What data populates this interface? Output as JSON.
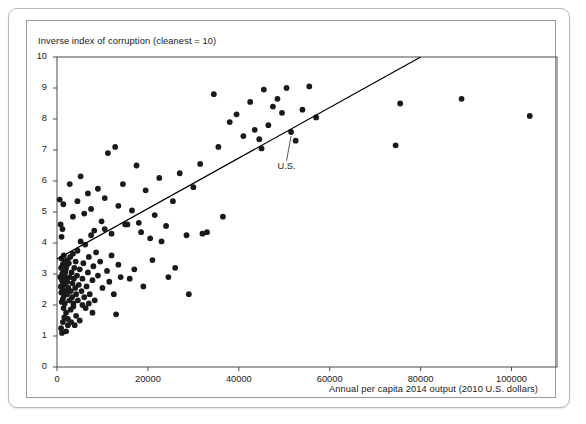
{
  "figure": {
    "background": "#ffffff",
    "frame_color": "#b8b8b8",
    "inner_frame_color": "#9a9a9a"
  },
  "chart_data": {
    "type": "scatter",
    "title": "",
    "subtitle": "",
    "xlabel": "Annual per capita 2014 output (2010 U.S. dollars)",
    "ylabel": "Inverse index of corruption (cleanest = 10)",
    "xlim": [
      0,
      110000
    ],
    "ylim": [
      0,
      10
    ],
    "xticks": [
      0,
      20000,
      40000,
      60000,
      80000,
      100000
    ],
    "xticklabels": [
      "0",
      "20000",
      "40000",
      "60000",
      "80000",
      "100000"
    ],
    "yticks": [
      0,
      1,
      2,
      3,
      4,
      5,
      6,
      7,
      8,
      9,
      10
    ],
    "yticklabels": [
      "0",
      "1",
      "2",
      "3",
      "4",
      "5",
      "6",
      "7",
      "8",
      "9",
      "10"
    ],
    "grid": false,
    "legend": null,
    "marker_color": "#1a1a1a",
    "marker_size": 4.2,
    "trendline": {
      "name": "regression line",
      "color": "#000000",
      "width": 1.3,
      "x_start": 0,
      "y_start": 3.48,
      "x_end": 80000,
      "y_end": 10.0
    },
    "annotations": [
      {
        "label": "U.S.",
        "point_x": 51500,
        "point_y": 7.58,
        "text_x": 50500,
        "text_y": 6.72
      }
    ],
    "points": [
      [
        700,
        2.9
      ],
      [
        850,
        2.6
      ],
      [
        900,
        3.2
      ],
      [
        950,
        2.4
      ],
      [
        1000,
        3.5
      ],
      [
        1050,
        2.1
      ],
      [
        1100,
        2.8
      ],
      [
        1150,
        3.0
      ],
      [
        1200,
        2.5
      ],
      [
        1250,
        3.3
      ],
      [
        1300,
        2.2
      ],
      [
        1350,
        2.7
      ],
      [
        1400,
        3.1
      ],
      [
        1450,
        1.9
      ],
      [
        1500,
        3.6
      ],
      [
        1550,
        2.3
      ],
      [
        1600,
        2.95
      ],
      [
        1650,
        3.4
      ],
      [
        1700,
        2.05
      ],
      [
        1750,
        2.65
      ],
      [
        1800,
        3.05
      ],
      [
        1900,
        2.45
      ],
      [
        1950,
        3.15
      ],
      [
        2000,
        1.75
      ],
      [
        2050,
        2.85
      ],
      [
        2100,
        3.25
      ],
      [
        2200,
        2.35
      ],
      [
        2250,
        2.75
      ],
      [
        2300,
        3.45
      ],
      [
        2400,
        1.55
      ],
      [
        2500,
        2.55
      ],
      [
        2600,
        3.35
      ],
      [
        2700,
        2.15
      ],
      [
        2800,
        2.9
      ],
      [
        2900,
        3.55
      ],
      [
        3000,
        2.45
      ],
      [
        3100,
        1.45
      ],
      [
        3200,
        3.05
      ],
      [
        3300,
        2.25
      ],
      [
        3400,
        2.7
      ],
      [
        3500,
        3.65
      ],
      [
        3600,
        2.05
      ],
      [
        3700,
        2.85
      ],
      [
        3800,
        3.2
      ],
      [
        3900,
        1.35
      ],
      [
        4000,
        2.55
      ],
      [
        4100,
        3.4
      ],
      [
        4200,
        2.35
      ],
      [
        4400,
        2.95
      ],
      [
        4500,
        3.75
      ],
      [
        4600,
        2.15
      ],
      [
        4800,
        2.65
      ],
      [
        5000,
        3.15
      ],
      [
        5200,
        4.05
      ],
      [
        5400,
        2.45
      ],
      [
        5600,
        2.85
      ],
      [
        5800,
        3.35
      ],
      [
        6000,
        2.25
      ],
      [
        6200,
        3.95
      ],
      [
        6500,
        2.6
      ],
      [
        6800,
        3.05
      ],
      [
        7000,
        3.55
      ],
      [
        7200,
        2.35
      ],
      [
        7500,
        4.25
      ],
      [
        7800,
        2.8
      ],
      [
        8000,
        3.25
      ],
      [
        8300,
        2.15
      ],
      [
        8600,
        3.7
      ],
      [
        9000,
        2.95
      ],
      [
        9500,
        3.4
      ],
      [
        10000,
        2.55
      ],
      [
        10500,
        4.45
      ],
      [
        11000,
        3.1
      ],
      [
        11500,
        2.75
      ],
      [
        12000,
        3.6
      ],
      [
        12500,
        2.35
      ],
      [
        13000,
        1.7
      ],
      [
        13500,
        3.3
      ],
      [
        14000,
        2.9
      ],
      [
        15000,
        4.6
      ],
      [
        600,
        5.4
      ],
      [
        800,
        4.6
      ],
      [
        1000,
        4.2
      ],
      [
        1200,
        4.45
      ],
      [
        1400,
        5.25
      ],
      [
        900,
        1.25
      ],
      [
        1100,
        1.1
      ],
      [
        1300,
        1.45
      ],
      [
        1600,
        1.6
      ],
      [
        2000,
        1.15
      ],
      [
        2400,
        1.35
      ],
      [
        3000,
        1.85
      ],
      [
        3600,
        1.95
      ],
      [
        4200,
        1.65
      ],
      [
        5000,
        1.5
      ],
      [
        5600,
        2.0
      ],
      [
        6300,
        1.9
      ],
      [
        7000,
        2.05
      ],
      [
        7800,
        1.75
      ],
      [
        2800,
        5.9
      ],
      [
        3500,
        4.85
      ],
      [
        4500,
        5.35
      ],
      [
        5200,
        6.15
      ],
      [
        6000,
        4.95
      ],
      [
        6800,
        5.6
      ],
      [
        7500,
        5.1
      ],
      [
        8200,
        4.4
      ],
      [
        9000,
        5.75
      ],
      [
        9800,
        4.7
      ],
      [
        10500,
        5.45
      ],
      [
        11200,
        6.9
      ],
      [
        12000,
        4.3
      ],
      [
        12800,
        7.1
      ],
      [
        13500,
        5.2
      ],
      [
        14500,
        5.9
      ],
      [
        15500,
        4.6
      ],
      [
        16500,
        5.05
      ],
      [
        17500,
        6.5
      ],
      [
        18500,
        4.35
      ],
      [
        19500,
        5.7
      ],
      [
        20500,
        4.15
      ],
      [
        21500,
        4.9
      ],
      [
        22500,
        6.1
      ],
      [
        24000,
        4.55
      ],
      [
        25500,
        5.35
      ],
      [
        27000,
        6.25
      ],
      [
        28500,
        4.25
      ],
      [
        30000,
        5.8
      ],
      [
        31500,
        6.55
      ],
      [
        33000,
        4.35
      ],
      [
        34500,
        8.8
      ],
      [
        35500,
        7.1
      ],
      [
        36500,
        4.85
      ],
      [
        38000,
        7.9
      ],
      [
        39500,
        8.15
      ],
      [
        41000,
        7.45
      ],
      [
        42500,
        8.55
      ],
      [
        43500,
        7.65
      ],
      [
        44500,
        7.35
      ],
      [
        45000,
        7.05
      ],
      [
        45500,
        8.95
      ],
      [
        46500,
        7.8
      ],
      [
        47500,
        8.4
      ],
      [
        48500,
        8.65
      ],
      [
        49500,
        8.2
      ],
      [
        50500,
        9.0
      ],
      [
        51500,
        7.58
      ],
      [
        52500,
        7.3
      ],
      [
        54000,
        8.3
      ],
      [
        55500,
        9.05
      ],
      [
        57000,
        8.05
      ],
      [
        74500,
        7.15
      ],
      [
        75500,
        8.5
      ],
      [
        89000,
        8.65
      ],
      [
        104000,
        8.1
      ],
      [
        17000,
        3.15
      ],
      [
        19000,
        2.6
      ],
      [
        21000,
        3.45
      ],
      [
        23000,
        4.05
      ],
      [
        26000,
        3.2
      ],
      [
        29000,
        2.35
      ],
      [
        32000,
        4.3
      ],
      [
        16000,
        2.85
      ],
      [
        18000,
        4.65
      ],
      [
        24500,
        2.9
      ]
    ]
  }
}
